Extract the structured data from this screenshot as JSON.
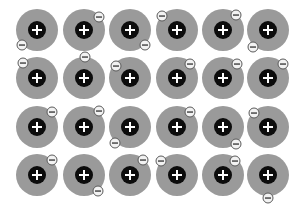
{
  "diagram": {
    "colors": {
      "ion_shell": "#9a9a9a",
      "ion_core": "#0c0c0c",
      "plus_sign": "#ffffff",
      "electron_fill": "#f2f2f2",
      "electron_stroke": "#5a5a5a",
      "minus_sign": "#333333",
      "background": "#ffffff"
    },
    "ion_symbol": "+",
    "electron_symbol": "−",
    "ion_radius": 21,
    "core_radius": 9,
    "electron_radius": 5,
    "columns_x": [
      37,
      84,
      130,
      177,
      223,
      268
    ],
    "rows_y": [
      30,
      78,
      127,
      175
    ],
    "electrons": [
      [
        22,
        45
      ],
      [
        99,
        17
      ],
      [
        145,
        45
      ],
      [
        162,
        16
      ],
      [
        236,
        15
      ],
      [
        253,
        47
      ],
      [
        23,
        63
      ],
      [
        85,
        57
      ],
      [
        116,
        66
      ],
      [
        190,
        64
      ],
      [
        237,
        64
      ],
      [
        283,
        64
      ],
      [
        52,
        112
      ],
      [
        99,
        111
      ],
      [
        115,
        143
      ],
      [
        190,
        112
      ],
      [
        236,
        144
      ],
      [
        254,
        113
      ],
      [
        52,
        160
      ],
      [
        98,
        191
      ],
      [
        143,
        160
      ],
      [
        161,
        161
      ],
      [
        235,
        161
      ],
      [
        268,
        198
      ]
    ]
  }
}
